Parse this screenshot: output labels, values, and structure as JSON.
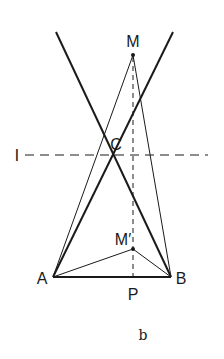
{
  "diagram": {
    "caption": "b",
    "colors": {
      "stroke": "#1a1a1a",
      "background": "#ffffff"
    },
    "points": {
      "M": {
        "label": "M",
        "x": 133,
        "y": 55
      },
      "C": {
        "label": "C",
        "x": 113,
        "y": 153
      },
      "A": {
        "label": "A",
        "x": 53,
        "y": 277
      },
      "B": {
        "label": "B",
        "x": 171,
        "y": 277
      },
      "M_prime": {
        "label": "M′",
        "x": 133,
        "y": 249
      },
      "P": {
        "label": "P",
        "x": 133,
        "y": 277
      }
    },
    "line_l": {
      "label": "l",
      "style": "dashed",
      "y": 155
    },
    "lines": [
      {
        "name": "line-through-B-and-C",
        "style": "thick"
      },
      {
        "name": "line-through-A-and-C",
        "style": "thick"
      },
      {
        "name": "segment-AB",
        "style": "thick"
      },
      {
        "name": "segment-MA",
        "style": "thin"
      },
      {
        "name": "segment-MB",
        "style": "thin"
      },
      {
        "name": "segment-M'A",
        "style": "thin"
      },
      {
        "name": "segment-M'B",
        "style": "thin"
      },
      {
        "name": "segment-MP",
        "style": "dashed"
      }
    ]
  }
}
